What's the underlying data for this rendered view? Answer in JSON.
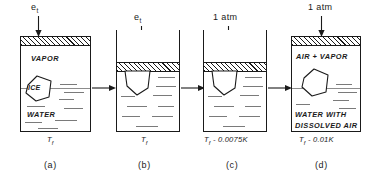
{
  "figure": {
    "panels": [
      {
        "id": "a",
        "caption": "(a)",
        "top_label": "e",
        "top_label_sub": "t",
        "temperature": "T",
        "temperature_sub": "f",
        "temperature_delta": "",
        "regions": [
          "VAPOR",
          "WATER"
        ],
        "ice_label": "ICE",
        "region_upper": "VAPOR",
        "region_lower": "WATER"
      },
      {
        "id": "b",
        "caption": "(b)",
        "top_label": "e",
        "top_label_sub": "t",
        "temperature": "T",
        "temperature_sub": "f",
        "temperature_delta": "",
        "regions": [],
        "ice_label": "",
        "region_upper": "",
        "region_lower": ""
      },
      {
        "id": "c",
        "caption": "(c)",
        "top_label": "1 atm",
        "top_label_sub": "",
        "temperature": "T",
        "temperature_sub": "f",
        "temperature_delta": " - 0.0075K",
        "regions": [],
        "ice_label": "",
        "region_upper": "",
        "region_lower": ""
      },
      {
        "id": "d",
        "caption": "(d)",
        "top_label": "1 atm",
        "top_label_sub": "",
        "temperature": "T",
        "temperature_sub": "f",
        "temperature_delta": " - 0.01K",
        "regions": [
          "AIR + VAPOR",
          "WATER WITH",
          "DISSOLVED AIR"
        ],
        "ice_label": "",
        "region_upper": "AIR + VAPOR",
        "region_lower_1": "WATER WITH",
        "region_lower_2": "DISSOLVED AIR"
      }
    ],
    "colors": {
      "line": "#1a1a1a",
      "water_dash": "#7a7a7a",
      "background": "#ffffff"
    }
  }
}
